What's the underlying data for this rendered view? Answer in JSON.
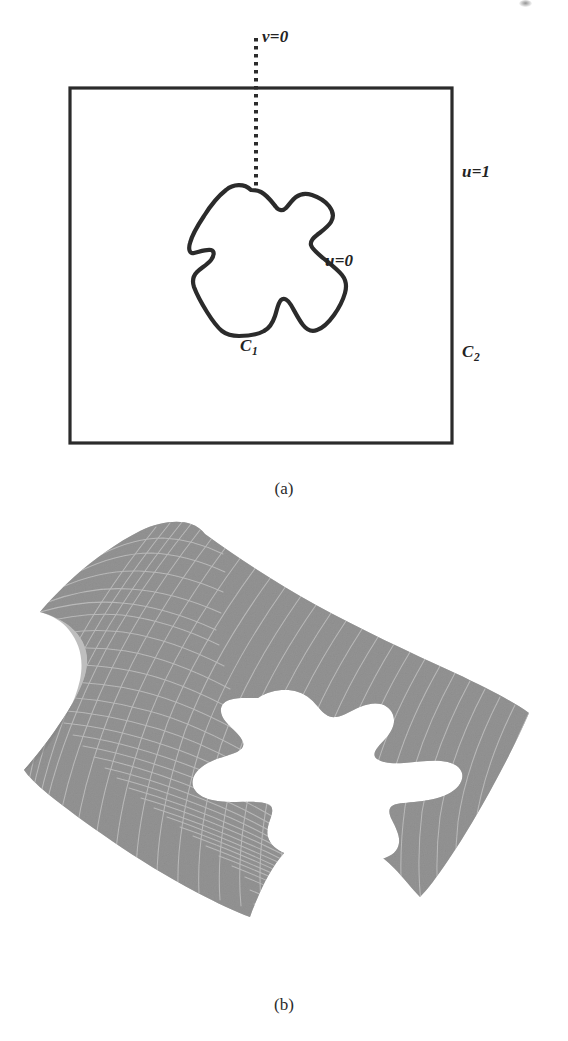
{
  "figure": {
    "type": "two-panel mathematical diagram",
    "panels": [
      {
        "caption": "(a)",
        "description": "Planar parameter domain: an outer square boundary C2 containing an irregular closed blob curve C1, with a dashed branch-cut line v=0 descending from above into the blob."
      },
      {
        "caption": "(b)",
        "description": "Corresponding warped three-dimensional surface drawn as a shaded gray quadrilateral mesh with white grid lines and a white blob-shaped hole at its center."
      }
    ]
  },
  "panel_a": {
    "labels": {
      "v_zero": "v=0",
      "u_one": "u=1",
      "u_zero": "u=0",
      "c_one_base": "C",
      "c_one_sub": "1",
      "c_two_base": "C",
      "c_two_sub": "2"
    },
    "caption": "(a)",
    "outer_boundary": {
      "name": "C2",
      "shape": "rectangle",
      "x": 70,
      "y": 88,
      "width": 382,
      "height": 355,
      "stroke": "#2b2b2b",
      "stroke_width": 3.2
    },
    "inner_curve": {
      "name": "C1",
      "shape": "closed irregular blob",
      "stroke": "#2b2b2b",
      "stroke_width": 4.2,
      "fill": "#ffffff"
    },
    "cut_line": {
      "name": "v=0",
      "style": "dotted",
      "x": 256,
      "y_start": 38,
      "y_end": 192,
      "stroke": "#2b2b2b",
      "stroke_width": 4.0
    }
  },
  "panel_b": {
    "caption": "(b)",
    "surface": {
      "mesh_fill": "#8c8c8c",
      "mesh_line": "#e8e8e8",
      "hole_fill": "#fbfbfb",
      "grid_u_lines": 30,
      "grid_v_lines": 26,
      "hole_shape": "blob"
    }
  },
  "colors": {
    "ink": "#2b2b2b",
    "paper": "#ffffff",
    "mesh_gray": "#8c8c8c",
    "mesh_grid": "#e8e8e8"
  }
}
